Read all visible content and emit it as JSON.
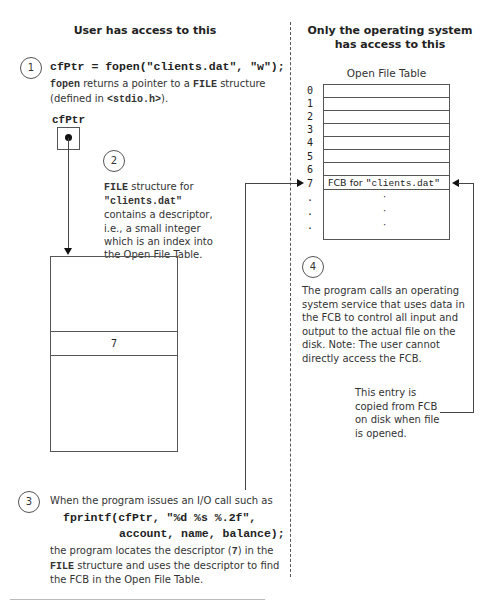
{
  "headers": {
    "left": "User has access to this",
    "right_line1": "Only the operating system",
    "right_line2": "has access to this"
  },
  "step1": {
    "number": "1",
    "code": "cfPtr = fopen(\"clients.dat\", \"w\");",
    "desc_code1": "fopen",
    "desc_text1": " returns a pointer to a ",
    "desc_code2": "FILE",
    "desc_text2": " structure",
    "desc_line2_text1": "(defined in ",
    "desc_line2_code": "<stdio.h>",
    "desc_line2_text2": ")."
  },
  "pointer": {
    "label": "cfPtr"
  },
  "step2": {
    "number": "2",
    "line1_code": "FILE",
    "line1_text": " structure for",
    "line2_code": "\"clients.dat\"",
    "line3": "contains a descriptor,",
    "line4": "i.e., a small integer",
    "line5": "which is an index into",
    "line6": "the Open File Table."
  },
  "file_struct": {
    "descriptor_value": "7"
  },
  "open_file_table": {
    "title": "Open File Table",
    "indices": [
      "0",
      "1",
      "2",
      "3",
      "4",
      "5",
      "6",
      "7",
      ".",
      ".",
      "."
    ],
    "fcb_entry_text": "FCB for ",
    "fcb_entry_code": "\"clients.dat\"",
    "ellipsis": [
      "·",
      "·",
      "·"
    ]
  },
  "step3": {
    "number": "3",
    "intro": "When the program issues an I/O call such as",
    "code_line1": "fprintf(cfPtr, \"%d %s %.2f\",",
    "code_line2": "account, name, balance);",
    "line1_text": "the program locates the descriptor (",
    "line1_code": "7",
    "line1_text2": ") in the",
    "line2_code": "FILE",
    "line2_text": " structure and uses the descriptor to find",
    "line3": "the FCB in the Open File Table."
  },
  "step4": {
    "number": "4",
    "lines": [
      "The program calls an operating",
      "system service that uses data in",
      "the FCB to control all input and",
      "output to the actual file on the",
      "disk. Note: The user cannot",
      "directly access the FCB."
    ]
  },
  "copy_note": {
    "lines": [
      "This entry is",
      "copied from FCB",
      "on disk when file",
      "is opened."
    ]
  }
}
